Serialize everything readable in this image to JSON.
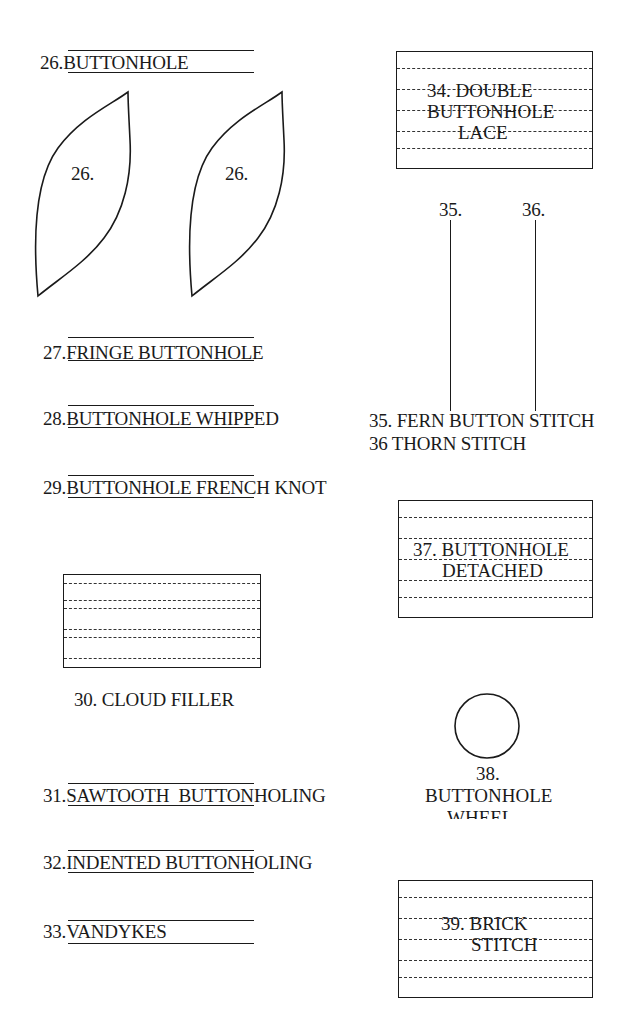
{
  "items": {
    "i26": {
      "number": "26.",
      "name": "BUTTONHOLE",
      "shape_label": "26."
    },
    "i27": {
      "number": "27.",
      "name": "FRINGE BUTTONHOLE"
    },
    "i28": {
      "number": "28.",
      "name": "BUTTONHOLE WHIPPED"
    },
    "i29": {
      "number": "29.",
      "name": "BUTTONHOLE FRENCH KNOT"
    },
    "i30": {
      "caption": "30. CLOUD FILLER"
    },
    "i31": {
      "number": "31.",
      "name": "SAWTOOTH  BUTTONHOLING"
    },
    "i32": {
      "number": "32.",
      "name": "INDENTED BUTTONHOLING"
    },
    "i33": {
      "number": "33.",
      "name": "VANDYKES"
    },
    "i34": {
      "line1": "34. DOUBLE",
      "line2": "BUTTONHOLE",
      "line3": "LACE"
    },
    "i35": {
      "marker": "35.",
      "caption": "35. FERN BUTTON STITCH"
    },
    "i36": {
      "marker": "36.",
      "caption": "36 THORN STITCH"
    },
    "i37": {
      "line1": "37. BUTTONHOLE",
      "line2": "DETACHED"
    },
    "i38": {
      "line1": "38.",
      "line2": "BUTTONHOLE",
      "line3": "WHEEL"
    },
    "i39": {
      "line1": "39. BRICK",
      "line2": "STITCH"
    }
  },
  "colors": {
    "ink": "#1a1a1a",
    "paper": "#ffffff"
  }
}
